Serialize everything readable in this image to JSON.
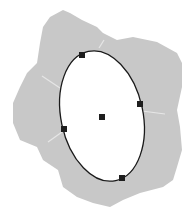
{
  "diagram": {
    "type": "ellipse-selection-on-region",
    "colors": {
      "background": "#ffffff",
      "region_fill": "#c8c8c8",
      "region_creases": "#e6e6e6",
      "ellipse_fill": "#ffffff",
      "ellipse_stroke": "#1a1a1a",
      "handle_fill": "#1e1e1e"
    },
    "region_outline": "M50,17 L63,10 L70,13 L82,20 L97,27 L103,33 L117,40 L133,37 L157,42 L177,53 L182,63 L182,87 L177,110 L180,127 L182,150 L177,167 L173,180 L163,187 L140,193 L123,200 L110,207 L93,203 L77,197 L63,187 L58,170 L43,160 L37,147 L20,140 L13,123 L13,103 L20,87 L27,73 L37,63 L40,43 L43,27 Z",
    "ellipse": {
      "cx": 102,
      "cy": 116,
      "rx": 41,
      "ry": 66,
      "rotate": -12
    },
    "handles": [
      {
        "name": "top",
        "x": 82,
        "y": 55
      },
      {
        "name": "right",
        "x": 140,
        "y": 104
      },
      {
        "name": "center",
        "x": 102,
        "y": 117
      },
      {
        "name": "left",
        "x": 64,
        "y": 129
      },
      {
        "name": "bottom",
        "x": 122,
        "y": 178
      }
    ]
  }
}
